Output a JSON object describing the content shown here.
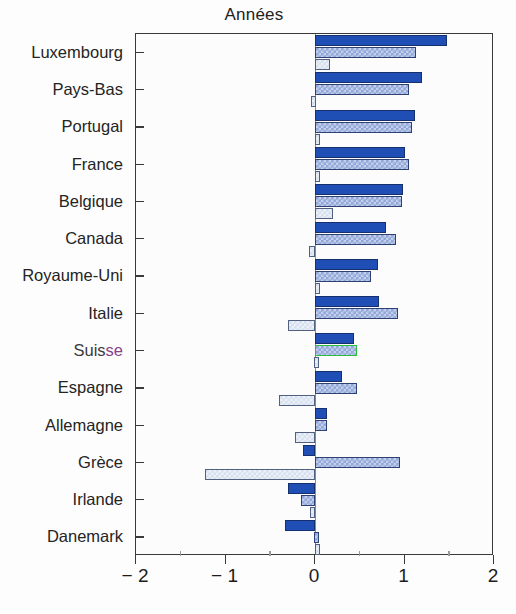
{
  "chart": {
    "title": "Années",
    "type": "bar"
  },
  "axis": {
    "x_ticklabels": [
      "− 2",
      "− 1",
      "0",
      "1",
      "2"
    ],
    "x_tickvalues": [
      -2,
      -1,
      0,
      1,
      2
    ],
    "x_minor_tickvalues": [
      -1.5,
      -0.5,
      0.5,
      1.5
    ]
  },
  "highlight": {
    "country": "Suisse",
    "label_prefix": "Suis",
    "label_suffix": "se",
    "outline_color": "#2bbd3e"
  },
  "colors": {
    "series_dark": "#1f4fb5",
    "series_medium": "#93a8da",
    "series_light": "#d6e0ef",
    "frame": "#3a3a3a",
    "zero_line": "#8a8a90",
    "highlight": "#2bbd3e"
  },
  "chart_data": {
    "type": "bar",
    "orientation": "horizontal",
    "title": "Années",
    "xlabel": "",
    "ylabel": "",
    "xlim": [
      -2,
      2
    ],
    "grid": false,
    "legend": "none",
    "categories": [
      "Luxembourg",
      "Pays-Bas",
      "Portugal",
      "France",
      "Belgique",
      "Canada",
      "Royaume-Uni",
      "Italie",
      "Suisse",
      "Espagne",
      "Allemagne",
      "Grèce",
      "Irlande",
      "Danemark"
    ],
    "series": [
      {
        "name": "serie-1-dark",
        "color": "#1f4fb5",
        "values": [
          1.47,
          1.2,
          1.12,
          1.0,
          0.98,
          0.79,
          0.7,
          0.72,
          0.44,
          0.3,
          0.13,
          -0.13,
          -0.3,
          -0.33
        ]
      },
      {
        "name": "serie-2-medium",
        "color": "#93a8da",
        "values": [
          1.13,
          1.05,
          1.08,
          1.05,
          0.97,
          0.91,
          0.63,
          0.93,
          0.47,
          0.47,
          0.13,
          0.95,
          -0.16,
          -0.01
        ]
      },
      {
        "name": "serie-3-light",
        "color": "#d6e0ef",
        "values": [
          0.17,
          -0.04,
          0.04,
          0.03,
          0.2,
          -0.07,
          0.04,
          -0.3,
          -0.01,
          -0.4,
          -0.22,
          -1.23,
          -0.06,
          0.05
        ]
      }
    ]
  }
}
